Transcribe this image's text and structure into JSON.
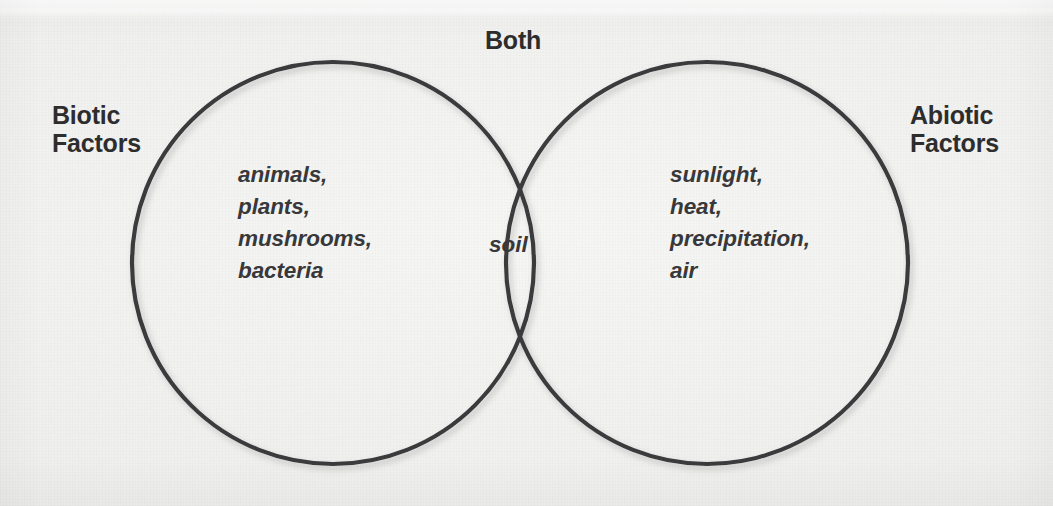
{
  "diagram": {
    "type": "venn",
    "title_visible": false,
    "colors": {
      "background": "#f3f3f2",
      "circle_stroke": "#3a3a3c",
      "label_text": "#2d2d2d",
      "item_text": "#38383a"
    },
    "left_label": "Biotic\nFactors",
    "right_label": "Abiotic\nFactors",
    "center_label": "Both",
    "sets": {
      "left": {
        "name": "Biotic Factors",
        "items": [
          "animals,",
          "plants,",
          "mushrooms,",
          "bacteria"
        ]
      },
      "right": {
        "name": "Abiotic Factors",
        "items": [
          "sunlight,",
          "heat,",
          "precipitation,",
          "air"
        ]
      },
      "intersection": {
        "name": "Both",
        "items": [
          "soil"
        ]
      }
    }
  }
}
